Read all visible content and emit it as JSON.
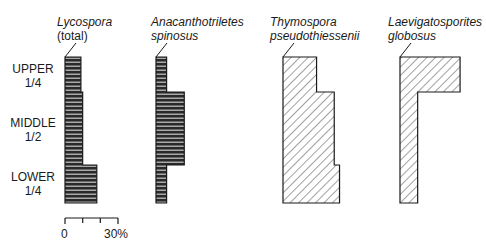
{
  "chart_data": {
    "type": "bar",
    "orientation": "horizontal-stratigraphic",
    "title": "",
    "categories": [
      "UPPER 1/4",
      "MIDDLE 1/2",
      "LOWER 1/4"
    ],
    "series": [
      {
        "name": "Lycospora (total)",
        "pattern": "horizontal",
        "values": [
          9,
          10,
          18
        ]
      },
      {
        "name": "Anacanthotriletes spinosus",
        "pattern": "horizontal",
        "values": [
          6,
          16,
          6
        ]
      },
      {
        "name": "Thymospora pseudothiessenii",
        "pattern": "diagonal",
        "values": [
          19,
          29,
          32
        ]
      },
      {
        "name": "Laevigatosporites globosus",
        "pattern": "diagonal",
        "values": [
          34,
          10,
          10
        ]
      }
    ],
    "xlabel": "",
    "ylabel": "",
    "scale": {
      "min": 0,
      "max": 30,
      "ticks": [
        0,
        10,
        20,
        30
      ],
      "tick_labels": [
        "0",
        "30%"
      ]
    },
    "grid": false
  },
  "zones": [
    {
      "line1": "UPPER",
      "line2": "1/4"
    },
    {
      "line1": "MIDDLE",
      "line2": "1/2"
    },
    {
      "line1": "LOWER",
      "line2": "1/4"
    }
  ],
  "taxa": [
    {
      "line1": "Lycospora",
      "line2": "(total)",
      "line2_italic": false
    },
    {
      "line1": "Anacanthotriletes",
      "line2": "spinosus",
      "line2_italic": true
    },
    {
      "line1": "Thymospora",
      "line2": "pseudothiessenii",
      "line2_italic": true
    },
    {
      "line1": "Laevigatosporites",
      "line2": "globosus",
      "line2_italic": true
    }
  ],
  "scale_labels": {
    "min": "0",
    "max": "30%"
  },
  "colors": {
    "ink": "#1a1a1a",
    "fill_dark": "#2a2a2a",
    "hatch": "#444444",
    "stripe": "#c8c8c8"
  }
}
